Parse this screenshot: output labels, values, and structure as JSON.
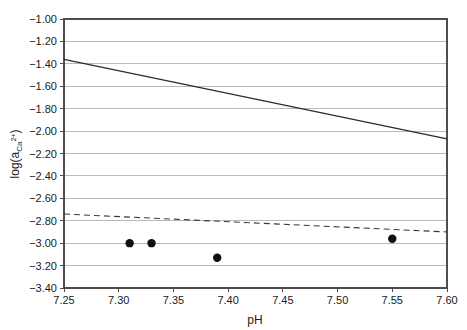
{
  "chart_data": {
    "type": "scatter",
    "title": "",
    "subtitle": "",
    "xlabel": "pH",
    "ylabel": "log(a_Ca2+)",
    "ylabel_parts": {
      "prefix": "log(a",
      "subscript": "Ca",
      "superscript": "2+",
      "suffix": ")"
    },
    "xlim": [
      7.25,
      7.6
    ],
    "ylim": [
      -3.4,
      -1.0
    ],
    "grid": "horizontal",
    "legend": "none",
    "xticks": [
      "7.25",
      "7.30",
      "7.35",
      "7.40",
      "7.45",
      "7.50",
      "7.55",
      "7.60"
    ],
    "xtick_values": [
      7.25,
      7.3,
      7.35,
      7.4,
      7.45,
      7.5,
      7.55,
      7.6
    ],
    "yticks": [
      "−1.00",
      "−1.20",
      "−1.40",
      "−1.60",
      "−1.80",
      "−2.00",
      "−2.20",
      "−2.40",
      "−2.60",
      "−2.80",
      "−3.00",
      "−3.20",
      "−3.40"
    ],
    "ytick_values": [
      -1.0,
      -1.2,
      -1.4,
      -1.6,
      -1.8,
      -2.0,
      -2.2,
      -2.4,
      -2.6,
      -2.8,
      -3.0,
      -3.2,
      -3.4
    ],
    "series": [
      {
        "name": "solid-line",
        "style": "solid",
        "color": "#2b2b2b",
        "x": [
          7.25,
          7.6
        ],
        "values": [
          -1.36,
          -2.07
        ]
      },
      {
        "name": "dashed-line",
        "style": "dashed",
        "color": "#3a3a3a",
        "x": [
          7.25,
          7.6
        ],
        "values": [
          -2.74,
          -2.9
        ]
      },
      {
        "name": "measured-points",
        "style": "markers",
        "color": "#101010",
        "x": [
          7.31,
          7.33,
          7.39,
          7.55
        ],
        "values": [
          -3.0,
          -3.0,
          -3.13,
          -2.96
        ]
      }
    ]
  }
}
